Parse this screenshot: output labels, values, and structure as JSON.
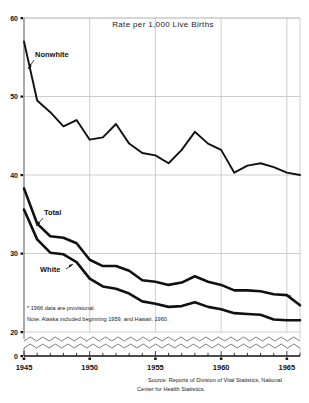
{
  "chart_data": {
    "type": "line",
    "title": "Rate per 1,000 Live Births",
    "xlabel": "",
    "ylabel": "",
    "xlim": [
      1945,
      1966
    ],
    "ylim": [
      20,
      60
    ],
    "y_axis_break": true,
    "y_break_value": 0,
    "grid": true,
    "yticks": [
      60,
      50,
      40,
      30,
      20,
      0
    ],
    "ytick_labels": [
      "60",
      "50",
      "40",
      "30",
      "20",
      "0"
    ],
    "xticks": [
      1945,
      1950,
      1955,
      1960,
      1965
    ],
    "xtick_labels": [
      "1945",
      "1950",
      "1955",
      "1960",
      "1965"
    ],
    "x": [
      1945,
      1946,
      1947,
      1948,
      1949,
      1950,
      1951,
      1952,
      1953,
      1954,
      1955,
      1956,
      1957,
      1958,
      1959,
      1960,
      1961,
      1962,
      1963,
      1964,
      1965,
      1966
    ],
    "series": [
      {
        "name": "Nonwhite",
        "values": [
          57.0,
          49.5,
          48.0,
          46.2,
          47.0,
          44.5,
          44.8,
          46.5,
          44.0,
          42.8,
          42.5,
          41.5,
          43.2,
          45.5,
          44.0,
          43.2,
          40.3,
          41.2,
          41.5,
          41.0,
          40.3,
          40.0
        ]
      },
      {
        "name": "Total",
        "values": [
          38.3,
          33.8,
          32.2,
          32.0,
          31.3,
          29.2,
          28.4,
          28.4,
          27.8,
          26.6,
          26.4,
          26.0,
          26.3,
          27.1,
          26.4,
          26.0,
          25.3,
          25.3,
          25.2,
          24.8,
          24.7,
          23.4
        ]
      },
      {
        "name": "White",
        "values": [
          35.6,
          31.8,
          30.1,
          29.9,
          28.9,
          26.8,
          25.8,
          25.5,
          24.9,
          23.9,
          23.6,
          23.2,
          23.3,
          23.8,
          23.2,
          22.9,
          22.4,
          22.3,
          22.2,
          21.6,
          21.5,
          21.5
        ]
      }
    ],
    "annotations": [
      {
        "text": "Nonwhite",
        "kind": "series-label"
      },
      {
        "text": "Total",
        "kind": "series-label"
      },
      {
        "text": "White",
        "kind": "series-label"
      }
    ]
  },
  "notes": {
    "footnote": "* 1966 data are provisional.",
    "alaska_note": "Note: Alaska included beginning 1959, and Hawaii, 1960.",
    "provisional_marker": "*"
  },
  "source": {
    "line1": "Source: Reports of Division of Vital Statistics, National",
    "line2": "Center for Health Statistics."
  }
}
